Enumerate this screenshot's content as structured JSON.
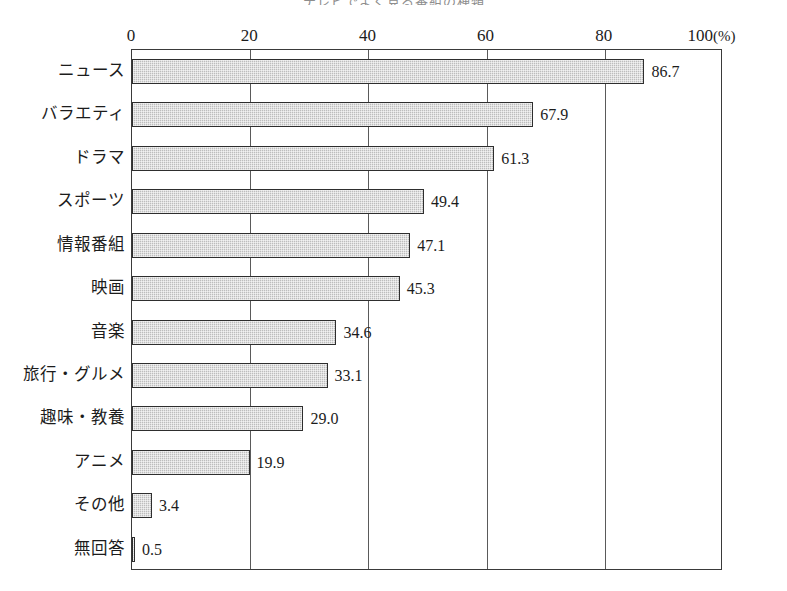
{
  "chart_data": {
    "type": "bar",
    "orientation": "horizontal",
    "title": "テレビでよく見る番組の種類",
    "title_right_mark": "",
    "caption": "",
    "xlabel": "",
    "ylabel": "",
    "unit": "(%)",
    "xlim": [
      0,
      100
    ],
    "xticks": [
      0,
      20,
      40,
      60,
      80,
      100
    ],
    "xtick_labels": [
      "0",
      "20",
      "40",
      "60",
      "80",
      "100"
    ],
    "grid": "vertical",
    "legend": "none",
    "axis_position": "top",
    "categories": [
      "ニュース",
      "バラエティ",
      "ドラマ",
      "スポーツ",
      "情報番組",
      "映画",
      "音楽",
      "旅行・グルメ",
      "趣味・教養",
      "アニメ",
      "その他",
      "無回答"
    ],
    "values": [
      86.7,
      67.9,
      61.3,
      49.4,
      47.1,
      45.3,
      34.6,
      33.1,
      29.0,
      19.9,
      3.4,
      0.5
    ],
    "value_labels": [
      "86.7",
      "67.9",
      "61.3",
      "49.4",
      "47.1",
      "45.3",
      "34.6",
      "33.1",
      "29.0",
      "19.9",
      "3.4",
      "0.5"
    ],
    "colors": {
      "bar_fill": "#bdbdbd",
      "bar_border": "#2e2e2e",
      "axis": "#3a3a3a",
      "gridline": "#5a5a5a",
      "text": "#1c1c1c",
      "background": "#ffffff"
    }
  }
}
